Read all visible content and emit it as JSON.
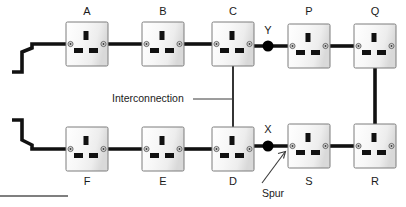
{
  "diagram": {
    "canvas": {
      "width": 406,
      "height": 207
    },
    "colors": {
      "cable_main": "#111111",
      "cable_interconnection": "#2b2b2b",
      "socket_face": "#f4f4f4",
      "socket_outline": "#7d7d7d",
      "pin": "#111111",
      "node_dot": "#000000",
      "text": "#1a1a1a",
      "background": "#ffffff"
    },
    "sockets": [
      {
        "id": "A",
        "label": "A",
        "x": 66,
        "y": 22,
        "w": 42,
        "h": 44,
        "label_x": 87,
        "label_y": 11,
        "label_pos": "above"
      },
      {
        "id": "B",
        "label": "B",
        "x": 142,
        "y": 22,
        "w": 42,
        "h": 44,
        "label_x": 163,
        "label_y": 11,
        "label_pos": "above"
      },
      {
        "id": "C",
        "label": "C",
        "x": 212,
        "y": 22,
        "w": 42,
        "h": 44,
        "label_x": 233,
        "label_y": 11,
        "label_pos": "above"
      },
      {
        "id": "P",
        "label": "P",
        "x": 288,
        "y": 22,
        "w": 42,
        "h": 44,
        "label_x": 309,
        "label_y": 11,
        "label_pos": "above"
      },
      {
        "id": "Q",
        "label": "Q",
        "x": 354,
        "y": 22,
        "w": 42,
        "h": 44,
        "label_x": 375,
        "label_y": 11,
        "label_pos": "above"
      },
      {
        "id": "F",
        "label": "F",
        "x": 66,
        "y": 127,
        "w": 42,
        "h": 44,
        "label_x": 87,
        "label_y": 182,
        "label_pos": "below"
      },
      {
        "id": "E",
        "label": "E",
        "x": 142,
        "y": 127,
        "w": 42,
        "h": 44,
        "label_x": 163,
        "label_y": 182,
        "label_pos": "below"
      },
      {
        "id": "D",
        "label": "D",
        "x": 212,
        "y": 127,
        "w": 42,
        "h": 44,
        "label_x": 233,
        "label_y": 182,
        "label_pos": "below"
      },
      {
        "id": "S",
        "label": "S",
        "x": 288,
        "y": 127,
        "w": 42,
        "h": 44,
        "label_x": 309,
        "label_y": 182,
        "label_pos": "below"
      },
      {
        "id": "R",
        "label": "R",
        "x": 354,
        "y": 127,
        "w": 42,
        "h": 44,
        "label_x": 375,
        "label_y": 182,
        "label_pos": "below"
      }
    ],
    "junctions": [
      {
        "id": "Y",
        "label": "Y",
        "cx": 268,
        "cy": 46,
        "r": 5.5,
        "label_x": 268,
        "label_y": 31
      },
      {
        "id": "X",
        "label": "X",
        "cx": 268,
        "cy": 146,
        "r": 5.5,
        "label_x": 268,
        "label_y": 130
      }
    ],
    "annotations": [
      {
        "id": "interconnection",
        "text": "Interconnection",
        "x": 112,
        "y": 99,
        "anchor": "start",
        "leader": "M 192 99 L 233 99"
      },
      {
        "id": "spur",
        "text": "Spur",
        "x": 272,
        "y": 193,
        "anchor": "middle",
        "leader": "M 262 184 L 284 153"
      }
    ],
    "cables": {
      "top_feed": "M 12 72 L 22 72 L 22 52 L 32 48 L 32 44 L 66 44",
      "bottom_feed": "M 12 120 L 22 120 L 22 140 L 32 145 L 32 149 L 66 149",
      "top_run_a_b": "M 108 44 L 142 44",
      "top_run_b_c": "M 184 44 L 212 44",
      "top_run_c_p": "M 254 46 L 288 46",
      "top_run_p_q": "M 330 46 L 354 46",
      "bottom_run_f_e": "M 108 149 L 142 149",
      "bottom_run_e_d": "M 184 149 L 212 149",
      "bottom_run_d_s": "M 254 146 L 288 146",
      "bottom_run_s_r": "M 330 146 L 354 146",
      "right_q_r": "M 375 66 L 375 127",
      "interconnection_c_d": "M 233 66 L 233 127"
    },
    "baseline_rule": {
      "x1": 0,
      "y1": 196,
      "x2": 68,
      "y2": 196
    }
  }
}
